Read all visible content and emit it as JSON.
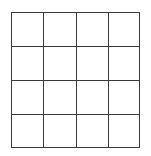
{
  "grid": {
    "rows": 4,
    "columns": 4,
    "line_color": "#3a3a3a",
    "background": "#ffffff",
    "cells": [
      [
        "",
        "",
        "",
        ""
      ],
      [
        "",
        "",
        "",
        ""
      ],
      [
        "",
        "",
        "",
        ""
      ],
      [
        "",
        "",
        "",
        ""
      ]
    ]
  }
}
